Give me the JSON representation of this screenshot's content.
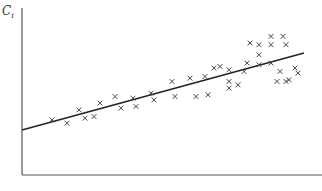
{
  "chart_data": {
    "type": "scatter",
    "title": "",
    "xlabel": "",
    "ylabel": "C",
    "ylabel_subscript": "i",
    "xlim": [
      0,
      100
    ],
    "ylim": [
      0,
      100
    ],
    "grid": false,
    "legend": null,
    "marker": "x",
    "colors": {
      "axis": "#555555",
      "marker": "#444444",
      "line": "#222222"
    },
    "series": [
      {
        "name": "observations",
        "points": [
          [
            10,
            33
          ],
          [
            15,
            31
          ],
          [
            19,
            39
          ],
          [
            21,
            34
          ],
          [
            24,
            35
          ],
          [
            26,
            43
          ],
          [
            31,
            47
          ],
          [
            33,
            40
          ],
          [
            37,
            46
          ],
          [
            38,
            41
          ],
          [
            43,
            49
          ],
          [
            44,
            45
          ],
          [
            50,
            56
          ],
          [
            51,
            47
          ],
          [
            56,
            58
          ],
          [
            58,
            47
          ],
          [
            61,
            59
          ],
          [
            62,
            48
          ],
          [
            64,
            64
          ],
          [
            66,
            65
          ],
          [
            69,
            52
          ],
          [
            69,
            56
          ],
          [
            69,
            63
          ],
          [
            72,
            54
          ],
          [
            74,
            62
          ],
          [
            75,
            67
          ],
          [
            76,
            79
          ],
          [
            79,
            78
          ],
          [
            79,
            72
          ],
          [
            83,
            83
          ],
          [
            83,
            78
          ],
          [
            87,
            83
          ],
          [
            88,
            78
          ],
          [
            79,
            66
          ],
          [
            83,
            67
          ],
          [
            85,
            56
          ],
          [
            88,
            56
          ],
          [
            86,
            62
          ],
          [
            91,
            64
          ],
          [
            89,
            57
          ],
          [
            92,
            61
          ]
        ]
      }
    ],
    "regression_line": {
      "x": [
        0,
        94
      ],
      "y": [
        27,
        73
      ]
    }
  }
}
